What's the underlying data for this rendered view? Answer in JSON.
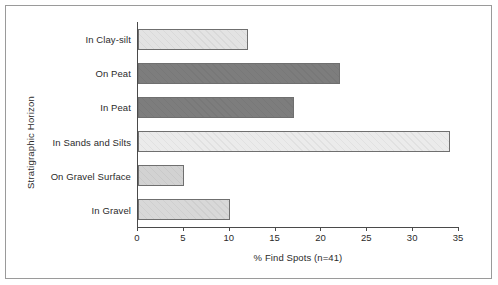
{
  "chart_data": {
    "type": "bar",
    "orientation": "horizontal",
    "title": "",
    "xlabel": "% Find Spots (n=41)",
    "ylabel": "Stratigraphic Horizon",
    "categories": [
      "In Clay-silt",
      "On Peat",
      "In Peat",
      "In Sands and Silts",
      "On Gravel Surface",
      "In Gravel"
    ],
    "values": [
      12,
      22,
      17,
      34,
      5,
      10
    ],
    "bar_colors": [
      "#e3e3e3",
      "#7d7d7d",
      "#7d7d7d",
      "#ebebeb",
      "#d2d2d2",
      "#d8d8d8"
    ],
    "bar_edge_color": "#6f6f6f",
    "xlim": [
      0,
      35
    ],
    "xticks": [
      0,
      5,
      10,
      15,
      20,
      25,
      30,
      35
    ],
    "xtick_labels": [
      "0",
      "5",
      "10",
      "15",
      "20",
      "25",
      "30",
      "35"
    ],
    "grid": false,
    "legend": false,
    "background_color": "#ffffff",
    "axis_color": "#4a4a4a",
    "frame_color": "#9a9a9a"
  }
}
